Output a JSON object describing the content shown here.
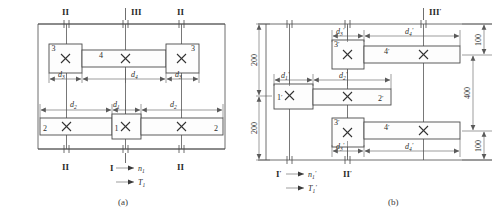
{
  "figure": {
    "title_a": "(a)",
    "title_b": "(b)"
  },
  "diagram_a": {
    "caption": "(a)",
    "shafts": [
      {
        "name": "shaft-I",
        "label": "I"
      },
      {
        "name": "shaft-II-left",
        "label": "II"
      },
      {
        "name": "shaft-III",
        "label": "III"
      },
      {
        "name": "shaft-II-right",
        "label": "II"
      },
      {
        "name": "shaft-II-bottom-left",
        "label": "II"
      },
      {
        "name": "shaft-II-bottom-right",
        "label": "II"
      }
    ],
    "gears": [
      {
        "name": "gear-3-left",
        "label": "3"
      },
      {
        "name": "gear-4",
        "label": "4"
      },
      {
        "name": "gear-3-right",
        "label": "3"
      },
      {
        "name": "gear-2-left",
        "label": "2"
      },
      {
        "name": "gear-1",
        "label": "1"
      },
      {
        "name": "gear-2-right",
        "label": "2"
      }
    ],
    "dimensions": [
      {
        "name": "dim-d3-left",
        "symbol": "d",
        "sub": "3"
      },
      {
        "name": "dim-d4",
        "symbol": "d",
        "sub": "4"
      },
      {
        "name": "dim-d3-right",
        "symbol": "d",
        "sub": "3"
      },
      {
        "name": "dim-d2-left",
        "symbol": "d",
        "sub": "2"
      },
      {
        "name": "dim-d1",
        "symbol": "d",
        "sub": "1"
      },
      {
        "name": "dim-d2-right",
        "symbol": "d",
        "sub": "2"
      }
    ],
    "input": {
      "shaft_label": "I",
      "speed": {
        "symbol": "n",
        "sub": "1"
      },
      "torque": {
        "symbol": "T",
        "sub": "1"
      }
    }
  },
  "diagram_b": {
    "caption": "(b)",
    "shafts": [
      {
        "name": "shaft-I-prime",
        "label": "I",
        "prime": "′"
      },
      {
        "name": "shaft-II-prime",
        "label": "II",
        "prime": "′"
      },
      {
        "name": "shaft-III-prime",
        "label": "III",
        "prime": "′"
      }
    ],
    "gears": [
      {
        "name": "gear-3-prime-top",
        "label": "3",
        "prime": "′"
      },
      {
        "name": "gear-4-prime-top",
        "label": "4",
        "prime": "′"
      },
      {
        "name": "gear-1-prime",
        "label": "1",
        "prime": "′"
      },
      {
        "name": "gear-2-prime",
        "label": "2",
        "prime": "′"
      },
      {
        "name": "gear-3-prime-bottom",
        "label": "3",
        "prime": "′"
      },
      {
        "name": "gear-4-prime-bottom",
        "label": "4",
        "prime": "′"
      }
    ],
    "dimensions": [
      {
        "name": "dim-d3-prime-top",
        "symbol": "d",
        "sub": "3",
        "prime": "′"
      },
      {
        "name": "dim-d4-prime-top",
        "symbol": "d",
        "sub": "4",
        "prime": "′"
      },
      {
        "name": "dim-d1-prime",
        "symbol": "d",
        "sub": "1",
        "prime": "′"
      },
      {
        "name": "dim-d2-prime",
        "symbol": "d",
        "sub": "2",
        "prime": "′"
      },
      {
        "name": "dim-d3-prime-bottom",
        "symbol": "d",
        "sub": "3",
        "prime": "′"
      },
      {
        "name": "dim-d4-prime-bottom",
        "symbol": "d",
        "sub": "4",
        "prime": "′"
      }
    ],
    "vertical_dims_left": [
      {
        "name": "dim-200-upper",
        "value": "200"
      },
      {
        "name": "dim-200-lower",
        "value": "200"
      }
    ],
    "vertical_dims_right": [
      {
        "name": "dim-100-upper",
        "value": "100"
      },
      {
        "name": "dim-400-middle",
        "value": "400"
      },
      {
        "name": "dim-100-lower",
        "value": "100"
      }
    ],
    "input": {
      "shaft_label": "I",
      "shaft_prime": "′",
      "speed": {
        "symbol": "n",
        "sub": "1",
        "prime": "′"
      },
      "torque": {
        "symbol": "T",
        "sub": "1",
        "prime": "′"
      }
    }
  },
  "colors": {
    "line": "#4a4a4a",
    "dim_line": "#5a5a5a",
    "text": "#2b2b2b",
    "background": "#ffffff",
    "box_fill": "#fdfdfd"
  }
}
